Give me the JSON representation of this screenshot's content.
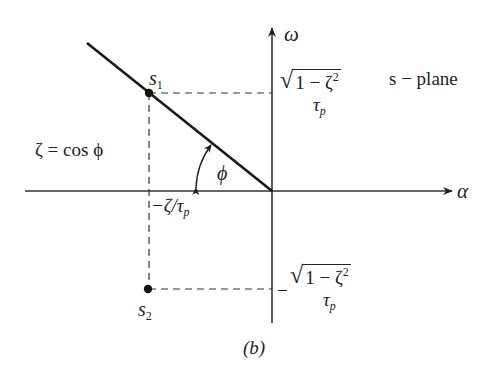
{
  "figure": {
    "caption": "(b)",
    "plane_label": "s − plane",
    "relation": "ζ = cos ϕ",
    "angle_label": "ϕ",
    "axes": {
      "x_label": "α",
      "y_label": "ω"
    },
    "points": [
      {
        "id": "s1",
        "label": "s",
        "subscript": "1",
        "position": "upper-left",
        "pos_px": [
          149,
          93
        ]
      },
      {
        "id": "s2",
        "label": "s",
        "subscript": "2",
        "position": "lower-left",
        "pos_px": [
          148,
          289
        ]
      }
    ],
    "ticks": {
      "real_part": {
        "prefix": "−ζ/τ",
        "subscript": "p"
      },
      "imag_upper": {
        "sign": "",
        "radicand": "1 − ζ",
        "exponent": "2",
        "denominator": "τ",
        "denominator_sub": "p"
      },
      "imag_lower": {
        "sign": "−",
        "radicand": "1 − ζ",
        "exponent": "2",
        "denominator": "τ",
        "denominator_sub": "p"
      }
    },
    "colors": {
      "ink": "#222222",
      "background": "#ffffff"
    }
  }
}
